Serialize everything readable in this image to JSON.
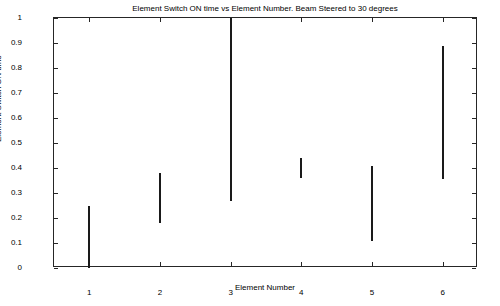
{
  "chart_data": {
    "type": "bar",
    "title": "Element Switch ON time vs Element Number. Beam Steered to 30 degrees",
    "xlabel": "Element Number",
    "ylabel": "Element Switch ON time",
    "categories": [
      "1",
      "2",
      "3",
      "4",
      "5",
      "6"
    ],
    "x": [
      1,
      2,
      3,
      4,
      5,
      6
    ],
    "bars": [
      {
        "element": 1,
        "label": "1",
        "start": 0.0,
        "end": 0.25
      },
      {
        "element": 2,
        "label": "2",
        "start": 0.18,
        "end": 0.38
      },
      {
        "element": 3,
        "label": "3",
        "start": 0.27,
        "end": 1.0
      },
      {
        "element": 4,
        "label": "4",
        "start": 0.36,
        "end": 0.44
      },
      {
        "element": 5,
        "label": "5",
        "start": 0.11,
        "end": 0.41
      },
      {
        "element": 6,
        "label": "6",
        "start": 0.355,
        "end": 0.89
      }
    ],
    "series": [
      {
        "name": "switch-on-start",
        "values": [
          0.0,
          0.18,
          0.27,
          0.36,
          0.11,
          0.355
        ]
      },
      {
        "name": "switch-on-end",
        "values": [
          0.25,
          0.38,
          1.0,
          0.44,
          0.41,
          0.89
        ]
      }
    ],
    "xlim": [
      0.5,
      6.5
    ],
    "ylim": [
      0,
      1
    ],
    "yticks": [
      0,
      0.1,
      0.2,
      0.3,
      0.4,
      0.5,
      0.6,
      0.7,
      0.8,
      0.9,
      1
    ],
    "ytick_labels": [
      "0",
      "0.1",
      "0.2",
      "0.3",
      "0.4",
      "0.5",
      "0.6",
      "0.7",
      "0.8",
      "0.9",
      "1"
    ],
    "xticks": [
      1,
      2,
      3,
      4,
      5,
      6
    ],
    "xtick_labels": [
      "1",
      "2",
      "3",
      "4",
      "5",
      "6"
    ],
    "grid": false,
    "legend": null,
    "bar_color": "#1a1a1a",
    "axis_color": "#262626",
    "background": "#ffffff"
  }
}
